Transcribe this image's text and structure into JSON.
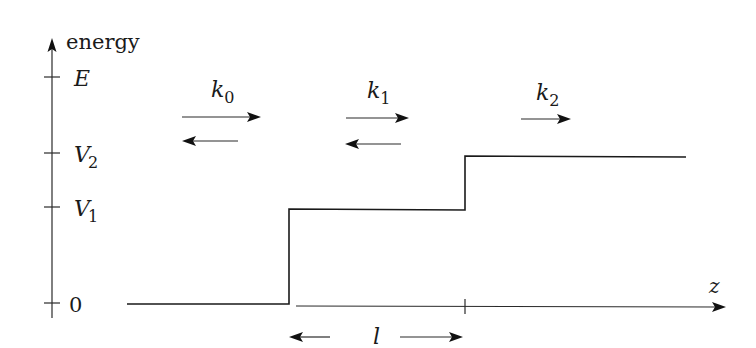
{
  "diagram": {
    "axes": {
      "y_label": "energy",
      "x_label": "z",
      "y_ticks": [
        {
          "label_main": "E",
          "label_sub": "",
          "y": 77
        },
        {
          "label_main": "V",
          "label_sub": "2",
          "y": 153
        },
        {
          "label_main": "V",
          "label_sub": "1",
          "y": 207
        },
        {
          "label_main": "0",
          "label_sub": "",
          "y": 303
        }
      ]
    },
    "regions": [
      {
        "wavevector_main": "k",
        "wavevector_sub": "0",
        "arrows": [
          "right",
          "left"
        ]
      },
      {
        "wavevector_main": "k",
        "wavevector_sub": "1",
        "arrows": [
          "right",
          "left"
        ]
      },
      {
        "wavevector_main": "k",
        "wavevector_sub": "2",
        "arrows": [
          "right"
        ]
      }
    ],
    "potential_levels": [
      "0",
      "V1",
      "V2"
    ],
    "width_label": "l",
    "colors": {
      "ink": "#1a1a1a",
      "background": "#ffffff"
    }
  }
}
